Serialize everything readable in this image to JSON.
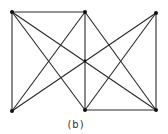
{
  "figure": {
    "caption": "(b)",
    "colors": {
      "edge": "#2a2a2a",
      "node": "#111111",
      "background": "#ffffff"
    },
    "nodes": [
      {
        "id": "TL",
        "x": 12,
        "y": 12
      },
      {
        "id": "TM",
        "x": 85,
        "y": 12
      },
      {
        "id": "TR",
        "x": 156,
        "y": 13
      },
      {
        "id": "BL",
        "x": 12,
        "y": 111
      },
      {
        "id": "BM",
        "x": 85,
        "y": 110
      },
      {
        "id": "BR",
        "x": 156,
        "y": 110
      }
    ],
    "edges": [
      [
        "TL",
        "TM"
      ],
      [
        "TL",
        "BL"
      ],
      [
        "TM",
        "BM"
      ],
      [
        "TR",
        "BR"
      ],
      [
        "BM",
        "BR"
      ],
      [
        "TL",
        "BM"
      ],
      [
        "TL",
        "BR"
      ],
      [
        "TM",
        "BL"
      ],
      [
        "BL",
        "TR"
      ],
      [
        "TM",
        "BR"
      ],
      [
        "BM",
        "TR"
      ]
    ]
  }
}
